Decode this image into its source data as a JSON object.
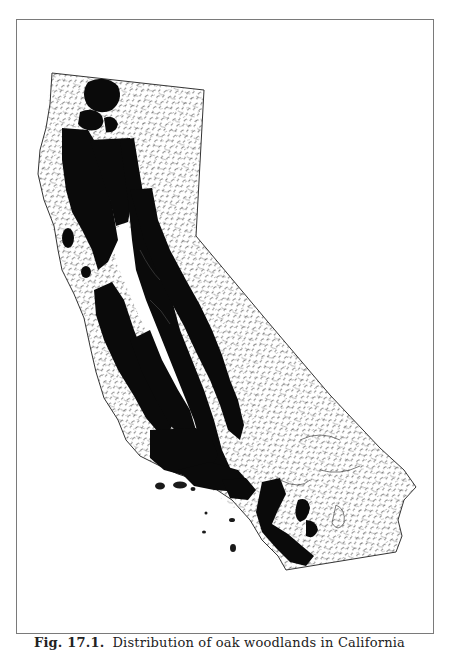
{
  "figure": {
    "caption_label": "Fig. 17.1.",
    "caption_text": "Distribution of oak woodlands in California",
    "colors": {
      "distribution_fill": "#0a0a0a",
      "outline": "#333333",
      "relief_hatching": "#4a4a4a",
      "frame": "#7a7a7a",
      "background": "#ffffff"
    }
  }
}
